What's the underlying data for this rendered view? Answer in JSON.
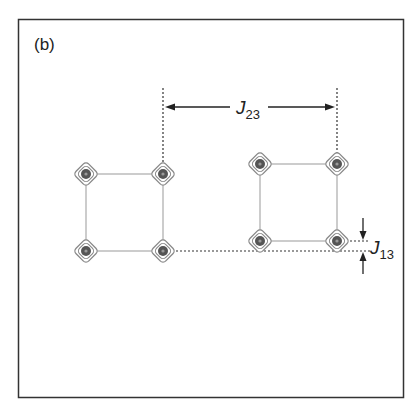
{
  "panel_label": "(b)",
  "coupling_labels": {
    "j23": {
      "main": "J",
      "sub": "23"
    },
    "j13": {
      "main": "J",
      "sub": "13"
    }
  },
  "colors": {
    "frame": "#333333",
    "connector": "#999999",
    "peak_outer": "#888888",
    "peak_core": "#555555",
    "dotted": "#333333",
    "arrow": "#222222"
  },
  "multiplets": [
    {
      "name": "left-multiplet",
      "peaks": [
        "top-left",
        "top-right",
        "bottom-left",
        "bottom-right"
      ]
    },
    {
      "name": "right-multiplet",
      "peaks": [
        "top-left",
        "top-right",
        "bottom-left",
        "bottom-right"
      ]
    }
  ]
}
